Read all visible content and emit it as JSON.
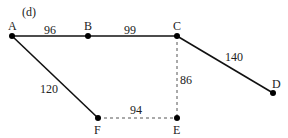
{
  "figure": {
    "panel_label": "(d)"
  },
  "colors": {
    "edge": "#111111",
    "dashed_edge": "#555555",
    "node": "#000000",
    "text": "#222222"
  },
  "nodes": [
    {
      "id": "A",
      "label": "A",
      "x": 12,
      "y": 36
    },
    {
      "id": "B",
      "label": "B",
      "x": 88,
      "y": 36
    },
    {
      "id": "C",
      "label": "C",
      "x": 177,
      "y": 36
    },
    {
      "id": "D",
      "label": "D",
      "x": 273,
      "y": 93
    },
    {
      "id": "E",
      "label": "E",
      "x": 177,
      "y": 118
    },
    {
      "id": "F",
      "label": "F",
      "x": 98,
      "y": 118
    }
  ],
  "edges": [
    {
      "from": "A",
      "to": "B",
      "weight": "96",
      "style": "solid"
    },
    {
      "from": "B",
      "to": "C",
      "weight": "99",
      "style": "solid"
    },
    {
      "from": "C",
      "to": "D",
      "weight": "140",
      "style": "solid"
    },
    {
      "from": "A",
      "to": "F",
      "weight": "120",
      "style": "solid"
    },
    {
      "from": "F",
      "to": "E",
      "weight": "94",
      "style": "dashed"
    },
    {
      "from": "C",
      "to": "E",
      "weight": "86",
      "style": "dashed"
    }
  ]
}
